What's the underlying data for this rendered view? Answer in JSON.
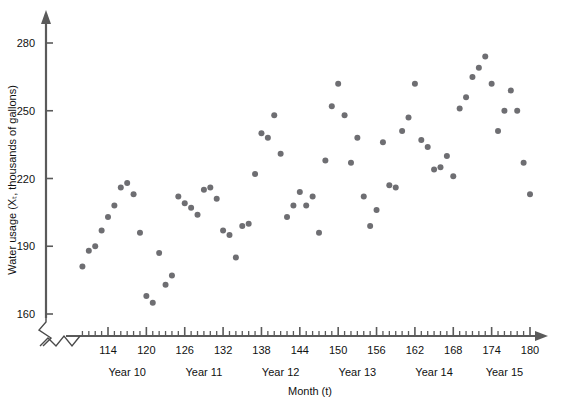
{
  "chart_data": {
    "type": "scatter",
    "title": "",
    "xlabel": "Month (t)",
    "ylabel": "Water usage (Xₜ, thousands of gallons)",
    "xlim": [
      108,
      182
    ],
    "ylim": [
      158,
      288
    ],
    "grid": false,
    "legend": "none",
    "axis_break_x": true,
    "axis_break_y": true,
    "yticks": [
      160,
      190,
      220,
      250,
      280
    ],
    "ytick_labels": [
      "160",
      "190",
      "220",
      "250",
      "280"
    ],
    "xticks": [
      114,
      120,
      126,
      132,
      138,
      144,
      150,
      156,
      162,
      168,
      174,
      180
    ],
    "xtick_labels": [
      "114",
      "120",
      "126",
      "132",
      "138",
      "144",
      "150",
      "156",
      "162",
      "168",
      "174",
      "180"
    ],
    "xtick_minor_step": 1,
    "xtick_minor_range": [
      110,
      181
    ],
    "group_labels": [
      {
        "text": "Year 10",
        "center_x": 117
      },
      {
        "text": "Year 11",
        "center_x": 129
      },
      {
        "text": "Year 12",
        "center_x": 141
      },
      {
        "text": "Year 13",
        "center_x": 153
      },
      {
        "text": "Year 14",
        "center_x": 165
      },
      {
        "text": "Year 15",
        "center_x": 176
      }
    ],
    "marker": {
      "shape": "circle",
      "size": 3.0,
      "color": "#6e6e72"
    },
    "x": [
      110,
      111,
      112,
      113,
      114,
      115,
      116,
      117,
      118,
      119,
      120,
      121,
      122,
      123,
      124,
      125,
      126,
      127,
      128,
      129,
      130,
      131,
      132,
      133,
      134,
      135,
      136,
      137,
      138,
      139,
      140,
      141,
      142,
      143,
      144,
      145,
      146,
      147,
      148,
      149,
      150,
      151,
      152,
      153,
      154,
      155,
      156,
      157,
      158,
      159,
      160,
      161,
      162,
      163,
      164,
      165,
      166,
      167,
      168,
      169,
      170,
      171,
      172,
      173,
      174,
      175,
      176,
      177,
      178,
      179,
      180
    ],
    "y": [
      181,
      188,
      190,
      197,
      203,
      208,
      216,
      218,
      213,
      196,
      168,
      165,
      187,
      173,
      177,
      212,
      209,
      207,
      204,
      215,
      216,
      211,
      197,
      195,
      185,
      199,
      200,
      222,
      240,
      238,
      248,
      231,
      203,
      208,
      214,
      208,
      212,
      196,
      228,
      252,
      262,
      248,
      227,
      238,
      212,
      199,
      206,
      236,
      217,
      216,
      241,
      247,
      262,
      237,
      234,
      224,
      225,
      230,
      221,
      251,
      256,
      265,
      269,
      274,
      262,
      241,
      250,
      259,
      250,
      227,
      213
    ]
  },
  "axis_colors": {
    "axis": "#5a5a5a",
    "marker": "#6e6e72",
    "text": "#111111",
    "background": "#ffffff"
  }
}
